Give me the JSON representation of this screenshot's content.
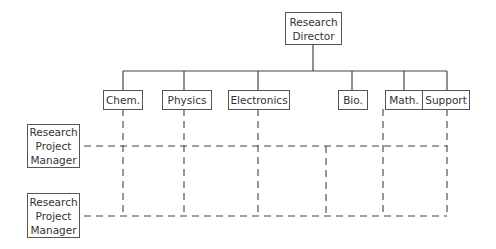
{
  "diagram": {
    "type": "matrix-organization-chart",
    "director": {
      "label_line1": "Research",
      "label_line2": "Director"
    },
    "departments": [
      {
        "label": "Chem."
      },
      {
        "label": "Physics"
      },
      {
        "label": "Electronics"
      },
      {
        "label": "Bio."
      },
      {
        "label": "Math."
      },
      {
        "label": "Support"
      }
    ],
    "managers": [
      {
        "line1": "Research",
        "line2": "Project",
        "line3": "Manager"
      },
      {
        "line1": "Research",
        "line2": "Project",
        "line3": "Manager"
      }
    ],
    "colors": {
      "line": "#444444",
      "background": "#ffffff"
    }
  }
}
